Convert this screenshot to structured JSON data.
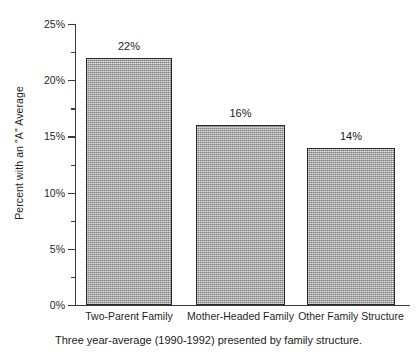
{
  "chart_data": {
    "type": "bar",
    "title": "",
    "subtitle": "",
    "categories": [
      "Two-Parent Family",
      "Mother-Headed Family",
      "Other Family Structure"
    ],
    "values": [
      22,
      16,
      14
    ],
    "value_labels": [
      "22%",
      "16%",
      "14%"
    ],
    "xlabel": "",
    "ylabel": "Percent with an \"A\" Average",
    "ylim": [
      0,
      25
    ],
    "y_major_ticks": [
      0,
      5,
      10,
      15,
      20,
      25
    ],
    "y_tick_labels": [
      "0%",
      "5%",
      "10%",
      "15%",
      "20%",
      "25%"
    ],
    "y_minor_ticks": [
      2.5,
      7.5,
      12.5,
      17.5,
      22.5
    ],
    "grid": false,
    "legend": false,
    "bar_fill_color": "#a9a9a9",
    "bar_border_color": "#2a2a2a",
    "axis_color": "#3a3a3a",
    "background_color": "#ffffff"
  },
  "caption": {
    "text": "Three year-average (1990-1992) presented by family structure."
  }
}
